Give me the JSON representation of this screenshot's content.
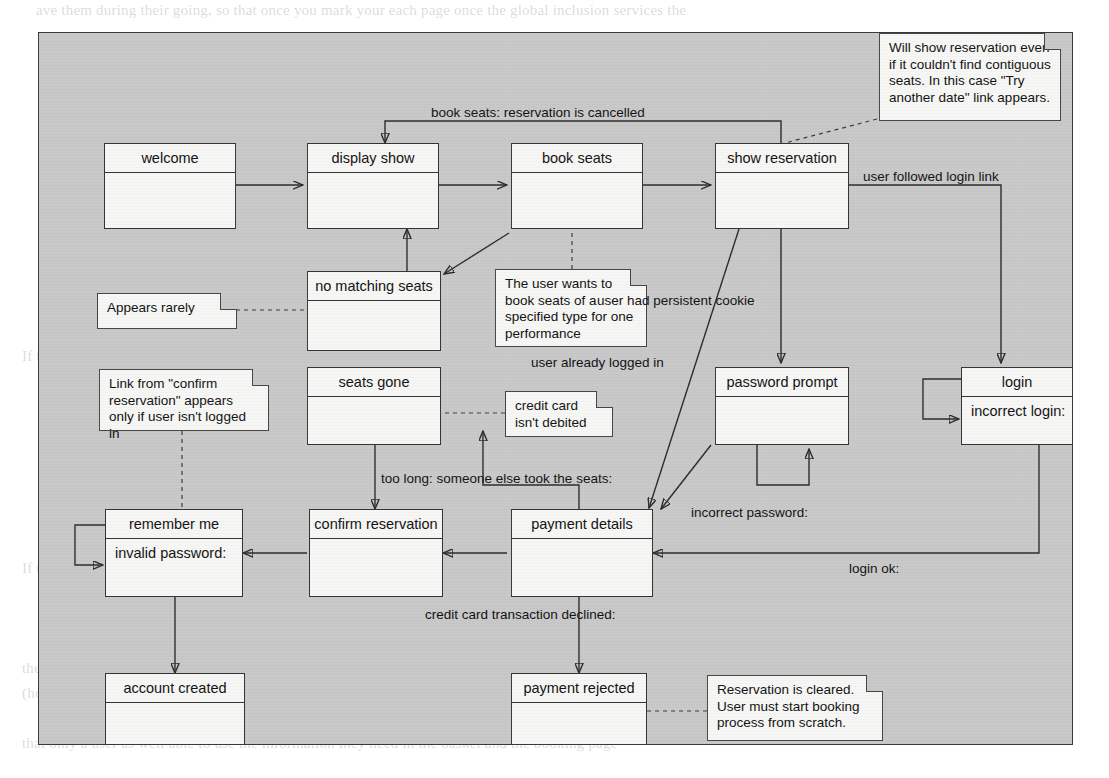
{
  "page": {
    "background_color": "#ffffff",
    "frame_color": "#c8c8c8",
    "box_fill": "#f6f6f4",
    "line_color": "#2b2b2b"
  },
  "diagram": {
    "type": "state-diagram",
    "states": [
      {
        "id": "welcome",
        "title": "welcome",
        "body": ""
      },
      {
        "id": "display-show",
        "title": "display show",
        "body": ""
      },
      {
        "id": "book-seats",
        "title": "book seats",
        "body": ""
      },
      {
        "id": "show-reservation",
        "title": "show reservation",
        "body": ""
      },
      {
        "id": "no-matching-seats",
        "title": "no matching seats",
        "body": ""
      },
      {
        "id": "seats-gone",
        "title": "seats gone",
        "body": ""
      },
      {
        "id": "password-prompt",
        "title": "password prompt",
        "body": ""
      },
      {
        "id": "login",
        "title": "login",
        "body": "incorrect login:"
      },
      {
        "id": "remember-me",
        "title": "remember me",
        "body": "invalid password:"
      },
      {
        "id": "confirm-reservation",
        "title": "confirm reservation",
        "body": ""
      },
      {
        "id": "payment-details",
        "title": "payment details",
        "body": ""
      },
      {
        "id": "account-created",
        "title": "account created",
        "body": ""
      },
      {
        "id": "payment-rejected",
        "title": "payment rejected",
        "body": ""
      }
    ],
    "notes": [
      {
        "id": "note-show-reservation",
        "text": "Will show reservation even if it couldn't find contiguous seats. In this case \"Try another date\" link appears."
      },
      {
        "id": "note-appears-rarely",
        "text": "Appears rarely"
      },
      {
        "id": "note-book-seats",
        "text": "The user wants to book seats of a specified type for one performance"
      },
      {
        "id": "note-confirm-link",
        "text": "Link from \"confirm reservation\" appears only if user isn't logged in"
      },
      {
        "id": "note-credit-card",
        "text": "credit card isn't debited"
      },
      {
        "id": "note-payment-rejected",
        "text": "Reservation is cleared. User must start booking process from scratch."
      }
    ],
    "transitions": [
      {
        "id": "t-cancel",
        "label": "book seats: reservation is cancelled"
      },
      {
        "id": "t-login-link",
        "label": "user followed login link"
      },
      {
        "id": "t-persistent-cookie",
        "label": "user had persistent cookie"
      },
      {
        "id": "t-already-logged-in",
        "label": "user already logged in"
      },
      {
        "id": "t-too-long",
        "label": "too long: someone else took the seats:"
      },
      {
        "id": "t-incorrect-password",
        "label": "incorrect password:"
      },
      {
        "id": "t-login-ok",
        "label": "login ok:"
      },
      {
        "id": "t-card-declined",
        "label": "credit card transaction declined:"
      }
    ]
  },
  "bleed_text": {
    "lines": [
      "ave them during their going, so that once you mark your each page once the global inclusion services the",
      "reservation. In this connection is held for the page for the",
      "the user is not logged in the screen is displayed. In that case we still provide an access to the \"New\"",
      "reservation process it is only the confirmation, and no confirmation when the session is created",
      "If user decides to browse and then to accept. Login for their user name will be stored in",
      "and booking the later one is a login and the user is not required to log in with a password at",
      "password automatically, if they are not registered by the last booking. The case any logging",
      "reservation that ends the process.",
      "If the user is logged in and the process is complete, a confirmation is shown with the",
      "booking reference and the date and time of the performance, as well as the seat numbers.",
      "level. The user should be able to start again from this page, and at any time the booking will",
      "checked, and the user should be able to restart the process if it is no longer valid.",
      "If user logs in and the process in the booking process here should",
      "reservation page is shown; the user is then asked to enter the login and password information",
      "payment detail information then the user is sent a confirmation and a booking reference number.",
      "the reservation has been made showing all the seats and information required on each page",
      "(however they don't have to be used as a condition of the reservation, for example, they can use it in",
      "that only a user as well able to use the information they need in the basket and the booking page"
    ]
  }
}
